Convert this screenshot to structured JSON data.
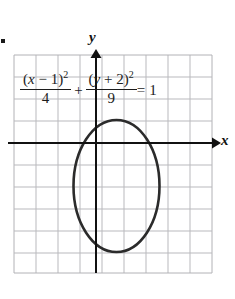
{
  "figure": {
    "type": "coordinate-graph",
    "bullet": "▪",
    "axes": {
      "x_label": "x",
      "y_label": "y",
      "x_axis_pixel_y": 143,
      "y_axis_pixel_x": 96
    },
    "grid": {
      "left": 14,
      "top": 55,
      "right": 212,
      "bottom": 273,
      "cell_size": 22,
      "columns": 9,
      "rows": 10,
      "color": "#b9b9bd",
      "border_color": "#b2b2b6"
    },
    "equation": {
      "term1": {
        "numerator_open": "(",
        "numerator_var": "x",
        "numerator_op": " − ",
        "numerator_const": "1",
        "numerator_close": ")",
        "numerator_exponent": "2",
        "denominator": "4"
      },
      "operator": "+",
      "term2": {
        "numerator_open": "(",
        "numerator_var": "y",
        "numerator_op": " + ",
        "numerator_const": "2",
        "numerator_close": ")",
        "numerator_exponent": "2",
        "denominator": "9"
      },
      "equals": "=",
      "rhs": "1",
      "plain_text": "(x - 1)^2/4 + (y + 2)^2/9 = 1"
    },
    "curve": {
      "shape": "ellipse",
      "center_pixel": [
        116.5,
        186
      ],
      "semi_axis_x_pixel": 43,
      "semi_axis_y_pixel": 66,
      "center_graph": [
        1,
        -2
      ],
      "a": 2,
      "b": 3,
      "stroke": "#2b2b2b",
      "stroke_width": 2.6
    },
    "colors": {
      "axis": "#111111",
      "grid": "#b9b9bd",
      "curve": "#2b2b2b",
      "background": "#ffffff"
    }
  }
}
